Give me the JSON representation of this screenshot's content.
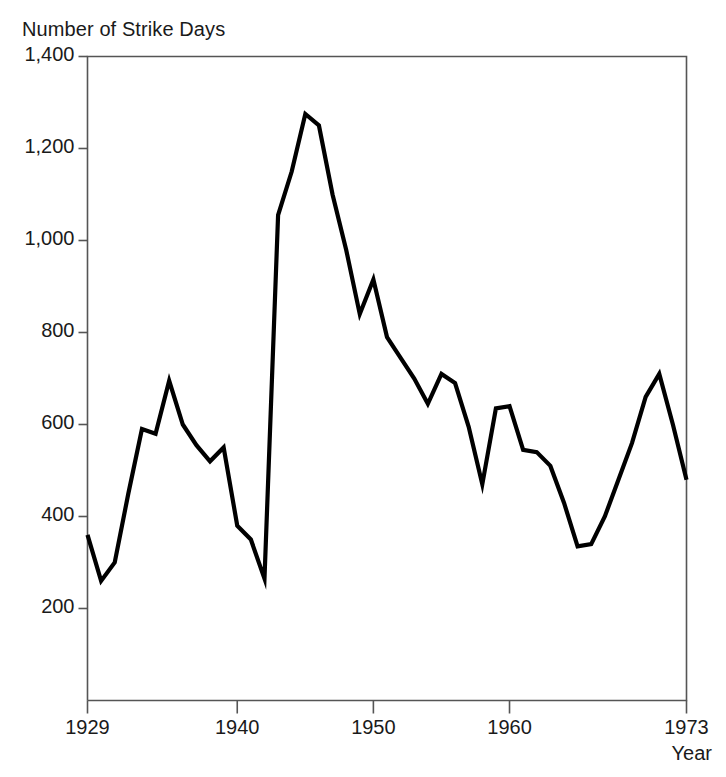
{
  "chart_data": {
    "type": "line",
    "title": "Number of Strike Days",
    "xlabel": "Year",
    "ylabel": "Number of Strike Days",
    "xlim": [
      1929,
      1973
    ],
    "ylim": [
      0,
      1400
    ],
    "grid": false,
    "legend": null,
    "ytick_labels": [
      "1,400",
      "1,200",
      "1,000",
      "800",
      "600",
      "400",
      "200"
    ],
    "ytick_values": [
      1400,
      1200,
      1000,
      800,
      600,
      400,
      200
    ],
    "xtick_labels": [
      "1929",
      "1940",
      "1950",
      "1960",
      "1973"
    ],
    "xtick_values": [
      1929,
      1940,
      1950,
      1960,
      1973
    ],
    "series_name": "Strike Days",
    "line_color": "#000000",
    "x": [
      1929,
      1930,
      1931,
      1932,
      1933,
      1934,
      1935,
      1936,
      1937,
      1938,
      1939,
      1940,
      1941,
      1942,
      1943,
      1944,
      1945,
      1946,
      1947,
      1948,
      1949,
      1950,
      1951,
      1952,
      1953,
      1954,
      1955,
      1956,
      1957,
      1958,
      1959,
      1960,
      1961,
      1962,
      1963,
      1964,
      1965,
      1966,
      1967,
      1968,
      1969,
      1970,
      1971,
      1972,
      1973
    ],
    "values": [
      360,
      260,
      300,
      450,
      590,
      580,
      695,
      600,
      555,
      520,
      550,
      380,
      350,
      265,
      1055,
      1150,
      1275,
      1250,
      1100,
      980,
      840,
      915,
      790,
      745,
      700,
      645,
      710,
      690,
      595,
      470,
      635,
      640,
      545,
      540,
      510,
      430,
      335,
      340,
      400,
      480,
      560,
      660,
      710,
      600,
      480
    ],
    "axis_color": "#555555",
    "background_color": "#ffffff"
  }
}
